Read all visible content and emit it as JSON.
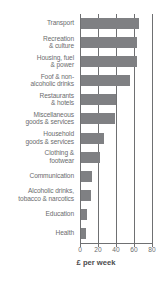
{
  "chart_data": {
    "type": "bar",
    "orientation": "horizontal",
    "title": "",
    "subtitle": "",
    "xlabel": "£ per week",
    "ylabel": "",
    "xlim": [
      0,
      80
    ],
    "xticks": [
      0,
      20,
      40,
      60,
      80
    ],
    "xtick_labels": [
      "0",
      "20",
      "40",
      "60",
      "80"
    ],
    "grid": true,
    "grid_axis": "x",
    "legend": false,
    "legend_position": "none",
    "bar_color": "#7f8083",
    "axis_color": "#6f7072",
    "text_color": "#6b6c6e",
    "categories": [
      "Transport",
      "Recreation & culture",
      "Housing, fuel & power",
      "Foof & non-alcoholic drinks",
      "Restaurants & hotels",
      "Miscellaneous goods & services",
      "Household goods & services",
      "Clothing & footwear",
      "Communication",
      "Alcoholic drinks, tobacco & narcotics",
      "Education",
      "Health"
    ],
    "category_lines": [
      [
        "Transport"
      ],
      [
        "Recreation",
        "& culture"
      ],
      [
        "Housing, fuel",
        "& power"
      ],
      [
        "Foof & non-",
        "alcoholic drinks"
      ],
      [
        "Restaurants",
        "& hotels"
      ],
      [
        "Miscellaneous",
        "goods & services"
      ],
      [
        "Household",
        "goods & services"
      ],
      [
        "Clothing &",
        "footwear"
      ],
      [
        "Communication"
      ],
      [
        "Alcoholic drinks,",
        "tobacco & narcotics"
      ],
      [
        "Education"
      ],
      [
        "Health"
      ]
    ],
    "values": [
      64,
      62.5,
      62,
      54,
      39,
      38,
      26,
      21,
      12.5,
      11,
      7,
      5
    ]
  }
}
